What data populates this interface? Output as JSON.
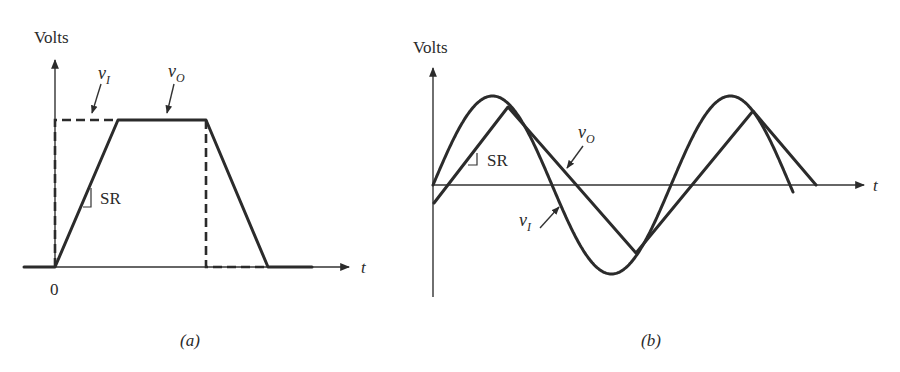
{
  "figure": {
    "panel_a": {
      "caption": "(a)",
      "y_axis_label": "Volts",
      "x_axis_label": "t",
      "origin_label": "0",
      "input_label": {
        "base": "v",
        "sub": "I"
      },
      "output_label": {
        "base": "v",
        "sub": "O"
      },
      "slope_label": "SR",
      "description": "Step input v_I (dashed) and slew-rate-limited trapezoidal output v_O (solid)"
    },
    "panel_b": {
      "caption": "(b)",
      "y_axis_label": "Volts",
      "x_axis_label": "t",
      "input_label": {
        "base": "v",
        "sub": "I"
      },
      "output_label": {
        "base": "v",
        "sub": "O"
      },
      "slope_label": "SR",
      "description": "Sinusoidal input v_I and slew-rate-limited triangular output v_O"
    }
  },
  "colors": {
    "ink": "#2b2b2b",
    "background": "#ffffff"
  }
}
